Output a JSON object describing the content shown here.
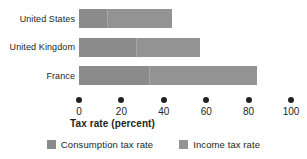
{
  "chart_data": {
    "type": "bar",
    "orientation": "horizontal",
    "stacked": true,
    "title": "",
    "xlabel": "Tax rate (percent)",
    "ylabel": "",
    "xlim": [
      0,
      100
    ],
    "xticks": [
      0,
      20,
      40,
      60,
      80,
      100
    ],
    "xticklabels": [
      "0",
      "20",
      "40",
      "60",
      "80",
      "100"
    ],
    "grid": false,
    "legend_position": "bottom",
    "categories": [
      "United States",
      "United Kingdom",
      "France"
    ],
    "series": [
      {
        "name": "Consumption tax rate",
        "color": "#8b8b8b",
        "values": [
          13,
          27,
          33
        ]
      },
      {
        "name": "Income tax rate",
        "color": "#939393",
        "values": [
          31,
          30,
          51
        ]
      }
    ],
    "totals": [
      44,
      57,
      84
    ]
  },
  "legend": {
    "items": [
      {
        "label": "Consumption tax rate",
        "swatch": "consumption"
      },
      {
        "label": "Income tax rate",
        "swatch": "income"
      }
    ]
  },
  "colors": {
    "consumption": "#8b8b8b",
    "income": "#939393",
    "text": "#231f20",
    "background": "#ffffff"
  }
}
